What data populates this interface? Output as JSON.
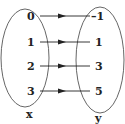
{
  "diagram": {
    "type": "mapping",
    "domain_label": "x",
    "range_label": "y",
    "domain_values": [
      "0",
      "1",
      "2",
      "3"
    ],
    "range_values": [
      "–1",
      "1",
      "3",
      "5"
    ],
    "mappings": [
      {
        "from": "0",
        "to": "–1"
      },
      {
        "from": "1",
        "to": "1"
      },
      {
        "from": "2",
        "to": "3"
      },
      {
        "from": "3",
        "to": "5"
      }
    ],
    "colors": {
      "stroke": "#333333",
      "text": "#222222",
      "background": "#ffffff"
    }
  }
}
